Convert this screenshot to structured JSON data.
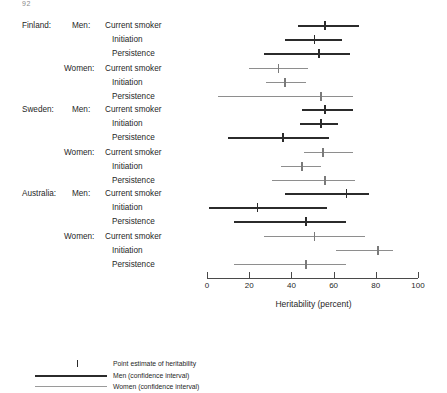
{
  "page_number": "92",
  "chart_data": {
    "type": "scatter",
    "title": "",
    "xlabel": "Heritability (percent)",
    "ylabel": "",
    "xlim": [
      0,
      100
    ],
    "xticks": [
      0,
      20,
      40,
      60,
      80,
      100
    ],
    "xticklabels": [
      "0",
      "20",
      "40",
      "60",
      "80",
      "100"
    ],
    "grid": false,
    "legend_position": "bottom-left",
    "groups": [
      {
        "country": "Finland:",
        "sexes": [
          {
            "sex": "Men:",
            "series": "men",
            "rows": [
              {
                "measure": "Current smoker",
                "estimate": 56,
                "low": 43,
                "high": 72
              },
              {
                "measure": "Initiation",
                "estimate": 51,
                "low": 37,
                "high": 64
              },
              {
                "measure": "Persistence",
                "estimate": 53,
                "low": 27,
                "high": 68
              }
            ]
          },
          {
            "sex": "Women:",
            "series": "women",
            "rows": [
              {
                "measure": "Current smoker",
                "estimate": 34,
                "low": 20,
                "high": 48
              },
              {
                "measure": "Initiation",
                "estimate": 37,
                "low": 28,
                "high": 47
              },
              {
                "measure": "Persistence",
                "estimate": 54,
                "low": 5,
                "high": 69
              }
            ]
          }
        ]
      },
      {
        "country": "Sweden:",
        "sexes": [
          {
            "sex": "Men:",
            "series": "men",
            "rows": [
              {
                "measure": "Current smoker",
                "estimate": 56,
                "low": 45,
                "high": 69
              },
              {
                "measure": "Initiation",
                "estimate": 54,
                "low": 44,
                "high": 62
              },
              {
                "measure": "Persistence",
                "estimate": 36,
                "low": 10,
                "high": 58
              }
            ]
          },
          {
            "sex": "Women:",
            "series": "women",
            "rows": [
              {
                "measure": "Current smoker",
                "estimate": 55,
                "low": 46,
                "high": 69
              },
              {
                "measure": "Initiation",
                "estimate": 45,
                "low": 35,
                "high": 54
              },
              {
                "measure": "Persistence",
                "estimate": 56,
                "low": 31,
                "high": 70
              }
            ]
          }
        ]
      },
      {
        "country": "Australia:",
        "sexes": [
          {
            "sex": "Men:",
            "series": "men",
            "rows": [
              {
                "measure": "Current smoker",
                "estimate": 66,
                "low": 37,
                "high": 77
              },
              {
                "measure": "Initiation",
                "estimate": 24,
                "low": 1,
                "high": 57
              },
              {
                "measure": "Persistence",
                "estimate": 47,
                "low": 13,
                "high": 66
              }
            ]
          },
          {
            "sex": "Women:",
            "series": "women",
            "rows": [
              {
                "measure": "Current smoker",
                "estimate": 51,
                "low": 27,
                "high": 75
              },
              {
                "measure": "Initiation",
                "estimate": 81,
                "low": 61,
                "high": 88
              },
              {
                "measure": "Persistence",
                "estimate": 47,
                "low": 13,
                "high": 66
              }
            ]
          }
        ]
      }
    ],
    "legend": [
      {
        "key": "point-estimate",
        "label": "Point estimate of heritability"
      },
      {
        "key": "men",
        "label": "Men (confidence interval)"
      },
      {
        "key": "women",
        "label": "Women (confidence interval)"
      }
    ],
    "colors": {
      "men": "#2b2b2b",
      "women": "#8e8e8e",
      "axis": "#4a4a4a",
      "text": "#1f1f1f"
    }
  }
}
